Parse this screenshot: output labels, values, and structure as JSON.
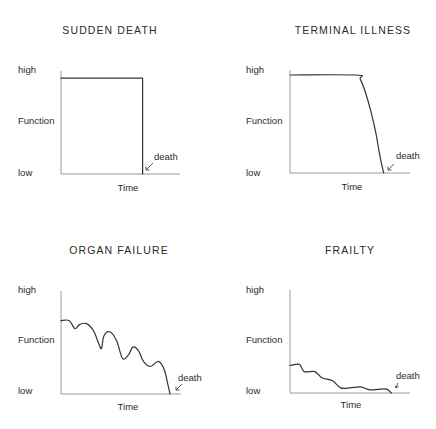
{
  "chart_data": [
    {
      "type": "line",
      "title": "SUDDEN DEATH",
      "xlabel": "Time",
      "ylabel": "Function",
      "ytick_labels": [
        "high",
        "low"
      ],
      "annotation": "death",
      "grid": false,
      "x_range": [
        0,
        100
      ],
      "y_range": [
        0,
        100
      ],
      "points": [
        [
          0,
          95
        ],
        [
          68,
          95
        ],
        [
          68,
          0
        ]
      ]
    },
    {
      "type": "line",
      "title": "TERMINAL ILLNESS",
      "xlabel": "Time",
      "ylabel": "Function",
      "ytick_labels": [
        "high",
        "low"
      ],
      "annotation": "death",
      "grid": false,
      "x_range": [
        0,
        100
      ],
      "y_range": [
        0,
        100
      ],
      "points": [
        [
          0,
          97
        ],
        [
          51,
          97
        ],
        [
          54,
          93
        ],
        [
          58,
          80
        ],
        [
          62,
          62
        ],
        [
          66,
          40
        ],
        [
          69,
          18
        ],
        [
          72,
          0
        ]
      ]
    },
    {
      "type": "line",
      "title": "ORGAN FAILURE",
      "xlabel": "Time",
      "ylabel": "Function",
      "ytick_labels": [
        "high",
        "low"
      ],
      "annotation": "death",
      "grid": false,
      "x_range": [
        0,
        100
      ],
      "y_range": [
        0,
        100
      ],
      "points": [
        [
          0,
          72
        ],
        [
          7,
          72
        ],
        [
          12,
          64
        ],
        [
          16,
          68
        ],
        [
          22,
          69
        ],
        [
          28,
          62
        ],
        [
          33,
          48
        ],
        [
          35,
          45
        ],
        [
          37,
          57
        ],
        [
          42,
          61
        ],
        [
          48,
          52
        ],
        [
          53,
          35
        ],
        [
          58,
          38
        ],
        [
          62,
          46
        ],
        [
          67,
          42
        ],
        [
          71,
          32
        ],
        [
          77,
          27
        ],
        [
          84,
          32
        ],
        [
          89,
          24
        ],
        [
          92,
          10
        ],
        [
          94,
          0
        ]
      ]
    },
    {
      "type": "line",
      "title": "FRAILTY",
      "xlabel": "Time",
      "ylabel": "Function",
      "ytick_labels": [
        "high",
        "low"
      ],
      "annotation": "death",
      "grid": false,
      "x_range": [
        0,
        100
      ],
      "y_range": [
        0,
        100
      ],
      "points": [
        [
          0,
          27
        ],
        [
          8,
          28
        ],
        [
          12,
          21
        ],
        [
          21,
          21
        ],
        [
          27,
          15
        ],
        [
          36,
          12
        ],
        [
          43,
          5
        ],
        [
          51,
          5
        ],
        [
          60,
          6
        ],
        [
          68,
          3
        ],
        [
          81,
          4
        ],
        [
          86,
          0
        ]
      ]
    }
  ],
  "panels": [
    {
      "title": "SUDDEN DEATH",
      "high": "high",
      "mid": "Function",
      "low": "low",
      "xlabel": "Time",
      "death": "death"
    },
    {
      "title": "TERMINAL ILLNESS",
      "high": "high",
      "mid": "Function",
      "low": "low",
      "xlabel": "Time",
      "death": "death"
    },
    {
      "title": "ORGAN FAILURE",
      "high": "high",
      "mid": "Function",
      "low": "low",
      "xlabel": "Time",
      "death": "death"
    },
    {
      "title": "FRAILTY",
      "high": "high",
      "mid": "Function",
      "low": "low",
      "xlabel": "Time",
      "death": "death"
    }
  ],
  "colors": {
    "axis": "#9a9a9a",
    "curve": "#333333",
    "text": "#2b2b2b",
    "background": "#ffffff"
  }
}
